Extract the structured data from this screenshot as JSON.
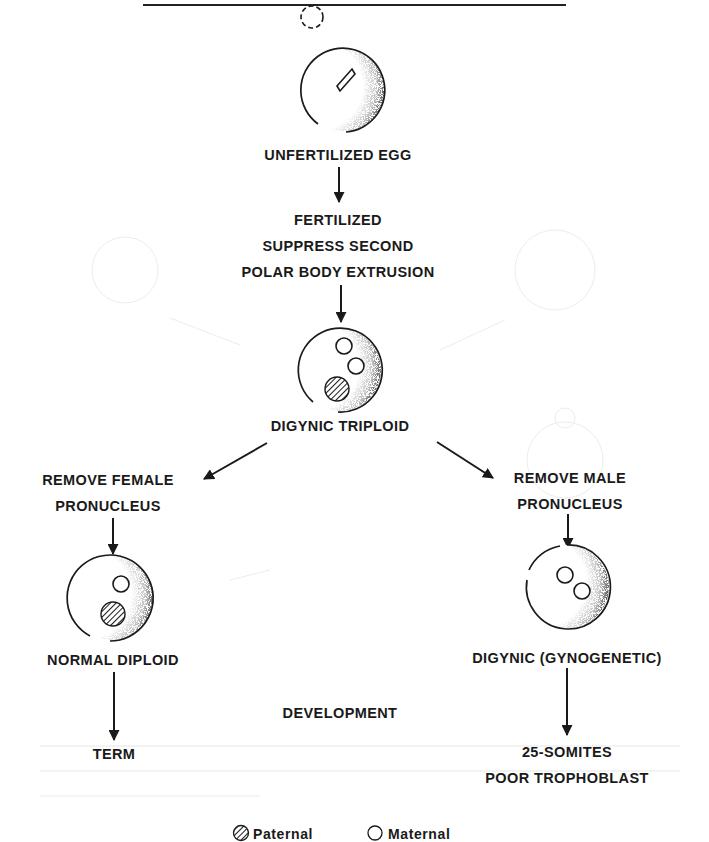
{
  "diagram": {
    "colors": {
      "ink": "#1a1a1a",
      "paper": "#ffffff",
      "showthrough": "#ececec"
    },
    "nodes": {
      "unfertilized_egg": {
        "label": "UNFERTILIZED EGG"
      },
      "fertilized": {
        "lines": [
          "FERTILIZED",
          "SUPPRESS SECOND",
          "POLAR BODY EXTRUSION"
        ]
      },
      "digynic_triploid": {
        "label": "DIGYNIC TRIPLOID",
        "pronuclei": [
          "maternal",
          "maternal",
          "paternal"
        ]
      },
      "remove_female": {
        "lines": [
          "REMOVE FEMALE",
          "PRONUCLEUS"
        ]
      },
      "remove_male": {
        "lines": [
          "REMOVE MALE",
          "PRONUCLEUS"
        ]
      },
      "normal_diploid": {
        "label": "NORMAL DIPLOID",
        "pronuclei": [
          "maternal",
          "paternal"
        ]
      },
      "digynic_gynogenetic": {
        "label": "DIGYNIC (GYNOGENETIC)",
        "pronuclei": [
          "maternal",
          "maternal"
        ]
      },
      "term": {
        "label": "TERM"
      },
      "somites": {
        "lines": [
          "25-SOMITES",
          "POOR TROPHOBLAST"
        ]
      }
    },
    "center_label": "DEVELOPMENT",
    "edges": [
      {
        "from": "unfertilized_egg",
        "to": "fertilized"
      },
      {
        "from": "fertilized",
        "to": "digynic_triploid"
      },
      {
        "from": "digynic_triploid",
        "to": "remove_female"
      },
      {
        "from": "digynic_triploid",
        "to": "remove_male"
      },
      {
        "from": "remove_female",
        "to": "normal_diploid"
      },
      {
        "from": "remove_male",
        "to": "digynic_gynogenetic"
      },
      {
        "from": "normal_diploid",
        "to": "term"
      },
      {
        "from": "digynic_gynogenetic",
        "to": "somites"
      }
    ],
    "legend": [
      {
        "key": "paternal",
        "label": "Paternal",
        "icon": "hatched-circle-icon"
      },
      {
        "key": "maternal",
        "label": "Maternal",
        "icon": "open-circle-icon"
      }
    ]
  }
}
